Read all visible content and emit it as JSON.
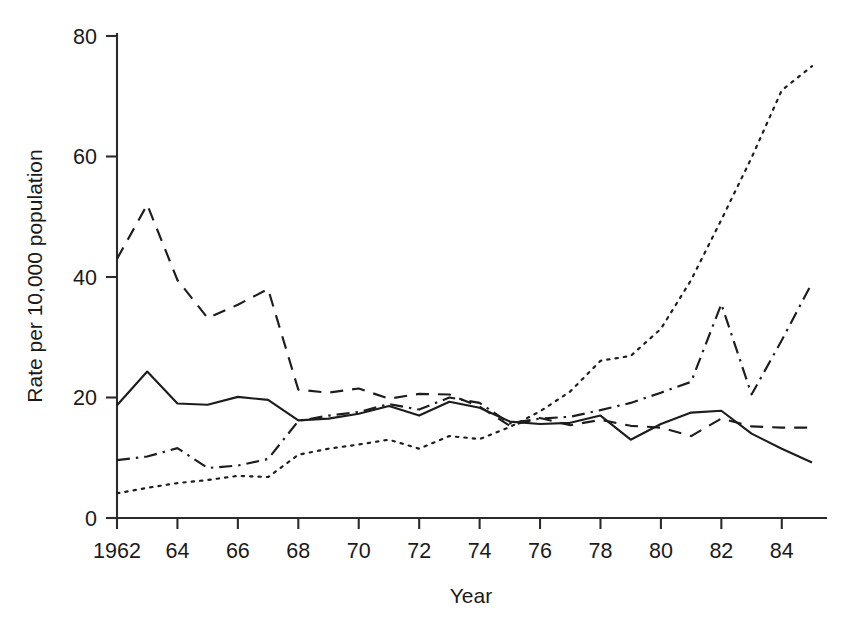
{
  "chart_data": {
    "type": "line",
    "title": "",
    "xlabel": "Year",
    "ylabel": "Rate per 10,000 population",
    "xlim": [
      1962,
      1985
    ],
    "ylim": [
      0,
      80
    ],
    "grid": false,
    "legend": "none",
    "y_ticks": [
      0,
      20,
      40,
      60,
      80
    ],
    "y_tick_labels": [
      "0",
      "20",
      "40",
      "60",
      "80"
    ],
    "x_ticks": [
      1962,
      1964,
      1966,
      1968,
      1970,
      1972,
      1974,
      1976,
      1978,
      1980,
      1982,
      1984
    ],
    "x_tick_labels": [
      "1962",
      "64",
      "66",
      "68",
      "70",
      "72",
      "74",
      "76",
      "78",
      "80",
      "82",
      "84"
    ],
    "x": [
      1962,
      1963,
      1964,
      1965,
      1966,
      1967,
      1968,
      1969,
      1970,
      1971,
      1972,
      1973,
      1974,
      1975,
      1976,
      1977,
      1978,
      1979,
      1980,
      1981,
      1982,
      1983,
      1984,
      1985
    ],
    "series": [
      {
        "name": "solid",
        "line_style": "solid",
        "color": "#1d1d1d",
        "values": [
          18.7,
          24.3,
          19.0,
          18.8,
          20.1,
          19.6,
          16.2,
          16.5,
          17.3,
          18.6,
          17.0,
          19.3,
          18.3,
          16.0,
          15.6,
          15.8,
          17.0,
          13.0,
          15.6,
          17.5,
          17.8,
          14.0,
          11.5,
          9.2
        ]
      },
      {
        "name": "dashed",
        "line_style": "dashed",
        "color": "#1d1d1d",
        "values": [
          43.0,
          52.0,
          39.5,
          33.2,
          35.4,
          38.0,
          21.3,
          20.8,
          21.5,
          19.8,
          20.6,
          20.5,
          18.5,
          15.3,
          16.6,
          15.4,
          16.3,
          15.3,
          15.0,
          13.6,
          16.5,
          15.2,
          15.0,
          15.0
        ]
      },
      {
        "name": "dash-dot",
        "line_style": "dashdot",
        "color": "#1d1d1d",
        "values": [
          9.6,
          10.2,
          11.6,
          8.3,
          8.7,
          9.8,
          16.1,
          17.0,
          17.6,
          18.9,
          18.0,
          20.0,
          19.1,
          15.7,
          16.5,
          16.8,
          17.9,
          19.1,
          20.8,
          22.6,
          35.5,
          20.5,
          29.5,
          39.0
        ]
      },
      {
        "name": "dotted",
        "line_style": "dotted",
        "color": "#1d1d1d",
        "values": [
          4.1,
          5.0,
          5.8,
          6.3,
          7.0,
          6.8,
          10.5,
          11.5,
          12.2,
          13.0,
          11.5,
          13.6,
          13.1,
          15.1,
          17.7,
          21.0,
          26.1,
          26.9,
          31.4,
          39.5,
          49.5,
          59.8,
          71.0,
          75.0
        ]
      }
    ]
  }
}
